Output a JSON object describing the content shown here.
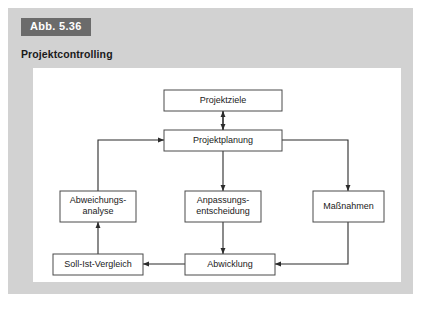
{
  "figure": {
    "number_label": "Abb. 5.36",
    "title": "Projektcontrolling"
  },
  "colors": {
    "card_background": "#d2d2d2",
    "panel_background": "#ffffff",
    "badge_background": "#6b6b6b",
    "badge_text": "#ffffff",
    "box_stroke": "#4a4a4a",
    "line_stroke": "#2b2b2b",
    "text": "#1a1a1a"
  },
  "diagram": {
    "type": "flowchart",
    "nodes": [
      {
        "id": "projektziele",
        "label": "Projektziele",
        "lines": [
          "Projektziele"
        ],
        "x": 131,
        "y": 22,
        "w": 118,
        "h": 21
      },
      {
        "id": "projektplanung",
        "label": "Projektplanung",
        "lines": [
          "Projektplanung"
        ],
        "x": 131,
        "y": 62,
        "w": 118,
        "h": 21
      },
      {
        "id": "abweichungsanalyse",
        "label": "Abweichungsanalyse",
        "lines": [
          "Abweichungs-",
          "analyse"
        ],
        "x": 27,
        "y": 123,
        "w": 76,
        "h": 31
      },
      {
        "id": "anpassungsentscheidung",
        "label": "Anpassungsentscheidung",
        "lines": [
          "Anpassungs-",
          "entscheidung"
        ],
        "x": 152,
        "y": 123,
        "w": 76,
        "h": 31
      },
      {
        "id": "massnahmen",
        "label": "Maßnahmen",
        "lines": [
          "Maßnahmen"
        ],
        "x": 280,
        "y": 123,
        "w": 71,
        "h": 31
      },
      {
        "id": "soll-ist-vergleich",
        "label": "Soll-Ist-Vergleich",
        "lines": [
          "Soll-Ist-Vergleich"
        ],
        "x": 20,
        "y": 186,
        "w": 90,
        "h": 21
      },
      {
        "id": "abwicklung",
        "label": "Abwicklung",
        "lines": [
          "Abwicklung"
        ],
        "x": 152,
        "y": 186,
        "w": 90,
        "h": 21
      }
    ],
    "edges": [
      {
        "id": "projektplanung-to-projektziele",
        "from": "projektplanung",
        "to": "projektziele",
        "points": "190,62 190,43",
        "arrow_end": true
      },
      {
        "id": "projektziele-to-projektplanung",
        "from": "projektziele",
        "to": "projektplanung",
        "points": "190,43 190,62",
        "arrow_end": true
      },
      {
        "id": "projektplanung-to-anpassungsentscheidung",
        "from": "projektplanung",
        "to": "anpassungsentscheidung",
        "points": "190,83 190,123",
        "arrow_end": true
      },
      {
        "id": "anpassungsentscheidung-to-abwicklung",
        "from": "anpassungsentscheidung",
        "to": "abwicklung",
        "points": "190,154 190,186",
        "arrow_end": true
      },
      {
        "id": "projektplanung-to-massnahmen",
        "from": "projektplanung",
        "to": "massnahmen",
        "points": "249,72 315,72 315,123",
        "arrow_end": true
      },
      {
        "id": "massnahmen-to-abwicklung",
        "from": "massnahmen",
        "to": "abwicklung",
        "points": "315,154 315,196 242,196",
        "arrow_end": true
      },
      {
        "id": "abwicklung-to-soll-ist-vergleich",
        "from": "abwicklung",
        "to": "soll-ist-vergleich",
        "points": "152,196 110,196",
        "arrow_end": true
      },
      {
        "id": "soll-ist-vergleich-to-abweichungsanalyse",
        "from": "soll-ist-vergleich",
        "to": "abweichungsanalyse",
        "points": "65,186 65,154",
        "arrow_end": true
      },
      {
        "id": "abweichungsanalyse-to-projektplanung",
        "from": "abweichungsanalyse",
        "to": "projektplanung",
        "points": "65,123 65,72 131,72",
        "arrow_end": true
      }
    ]
  }
}
